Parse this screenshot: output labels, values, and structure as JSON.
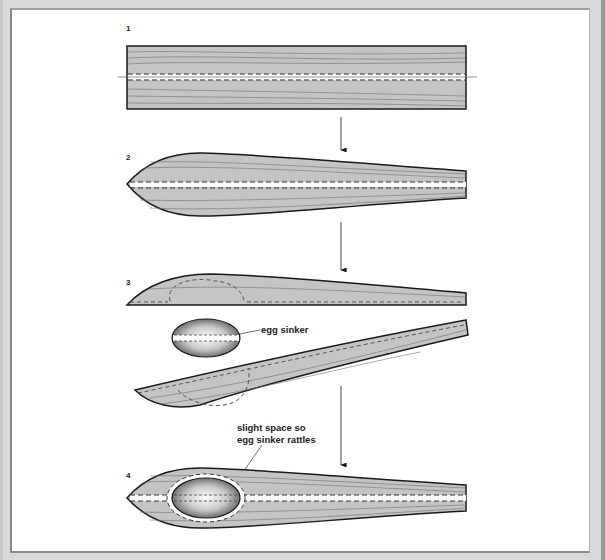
{
  "figure": {
    "colors": {
      "wood_fill": "#c4c4c4",
      "outline": "#1a1a1a",
      "grain": "#707070",
      "background": "#ffffff",
      "frame": "#d9d9d9"
    },
    "steps": [
      {
        "number": "1",
        "label": "1",
        "description": "Rectangular wood blank with a center cut line"
      },
      {
        "number": "2",
        "label": "2",
        "description": "Blank shaped into a tapered body, split along the center line"
      },
      {
        "number": "3",
        "label": "3",
        "description": "Body halves separated; cavity carved for egg sinker"
      },
      {
        "number": "4",
        "label": "4",
        "description": "Halves rejoined with egg sinker inside the cavity"
      }
    ],
    "annotations": {
      "egg_sinker": "egg sinker",
      "rattle_line1": "slight space so",
      "rattle_line2": "egg sinker rattles"
    }
  }
}
